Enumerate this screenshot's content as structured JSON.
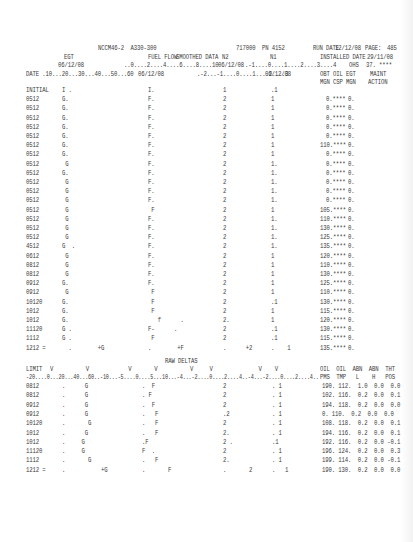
{
  "header": {
    "engine": "NCCM46-2  A330-300",
    "code": "717000",
    "pn": "PN 4152",
    "run_date_label": "RUN DATE",
    "run_date": "12/12/08",
    "page_label": "PAGE:",
    "page": "485",
    "installed_label": "INSTALLED DATE",
    "installed_date": "29/11/08",
    "ohs_label": "OHS",
    "ohs_value": "37.",
    "ohs_stars": "****"
  },
  "top_table": {
    "col_egt": "EGT",
    "col_egt_date": "06/12/08",
    "col_egt_scale": "DATE .10...20...30...40...50...60",
    "col_ff": "FUEL FLOW",
    "col_smoothed": "SMOOTHED DATA",
    "col_ff_scale": "..0....2....4....6....8....10",
    "col_ff_date": "06/12/08",
    "col_n2": "N2",
    "col_n2_date": "06/12/08",
    "col_n2_scale": ".-2...-1....0....1....2....3",
    "col_n1": "N1",
    "col_n1_scale": ".-1....0....1....2....3....4",
    "col_n1_date": "06/12/08",
    "col_right_h1": "OBT OIL EGT",
    "col_right_h2": "MGN CSP MGN",
    "col_maint_h1": "MAINT",
    "col_maint_h2": "ACTION",
    "rows": [
      {
        "date": "INITIAL",
        "egt": "I .",
        "ff": "I.",
        "n2": "1",
        "n1": ".1",
        "obt": "",
        "oil": "",
        "maint": ""
      },
      {
        "date": "0512",
        "egt": "G.",
        "ff": "F.",
        "n2": "2",
        "n1": "1",
        "obt": "0.****",
        "oil": "0."
      },
      {
        "date": "0512",
        "egt": "G.",
        "ff": "F.",
        "n2": "2",
        "n1": "1",
        "obt": "0.****",
        "oil": "0."
      },
      {
        "date": "0512",
        "egt": "G.",
        "ff": "F.",
        "n2": "2",
        "n1": "1",
        "obt": "0.****",
        "oil": "0."
      },
      {
        "date": "0512",
        "egt": "G.",
        "ff": "F.",
        "n2": "2",
        "n1": "1",
        "obt": "0.****",
        "oil": "0."
      },
      {
        "date": "0512",
        "egt": "G.",
        "ff": "F.",
        "n2": "2",
        "n1": "1",
        "obt": "0.****",
        "oil": "0."
      },
      {
        "date": "0512",
        "egt": "G.",
        "ff": "F.",
        "n2": "2",
        "n1": "1",
        "obt": "110.****",
        "oil": "0."
      },
      {
        "date": "0512",
        "egt": "G.",
        "ff": "F.",
        "n2": "2",
        "n1": "1",
        "obt": "0.****",
        "oil": "0."
      },
      {
        "date": "0512",
        "egt": " G",
        "ff": "F.",
        "n2": "2",
        "n1": "1.",
        "obt": "0.****",
        "oil": "0."
      },
      {
        "date": "0512",
        "egt": "G.",
        "ff": "F.",
        "n2": "2",
        "n1": "1.",
        "obt": "0.****",
        "oil": "0."
      },
      {
        "date": "0512",
        "egt": " G",
        "ff": "F.",
        "n2": "2",
        "n1": "1.",
        "obt": "0.****",
        "oil": "0."
      },
      {
        "date": "0512",
        "egt": " G",
        "ff": "F.",
        "n2": "2",
        "n1": "1.",
        "obt": "0.****",
        "oil": "0."
      },
      {
        "date": "0512",
        "egt": " G",
        "ff": "F.",
        "n2": "2",
        "n1": "1.",
        "obt": "0.****",
        "oil": "0."
      },
      {
        "date": "0512",
        "egt": " G",
        "ff": " F",
        "n2": "2",
        "n1": "1",
        "obt": "105.****",
        "oil": "0."
      },
      {
        "date": "0512",
        "egt": " G",
        "ff": "F.",
        "n2": "2",
        "n1": "1.",
        "obt": "110.****",
        "oil": "0."
      },
      {
        "date": "0512",
        "egt": " G",
        "ff": "F.",
        "n2": "2",
        "n1": "1.",
        "obt": "130.****",
        "oil": "0."
      },
      {
        "date": "0512",
        "egt": " G",
        "ff": "F.",
        "n2": "2",
        "n1": "1.",
        "obt": "125.****",
        "oil": "0."
      },
      {
        "date": "4512",
        "egt": "G  .",
        "ff": "F.",
        "n2": "2",
        "n1": "1.",
        "obt": "135.****",
        "oil": "0."
      },
      {
        "date": "0612",
        "egt": " G",
        "ff": "F.",
        "n2": "2",
        "n1": "1",
        "obt": "120.****",
        "oil": "0."
      },
      {
        "date": "0812",
        "egt": " G",
        "ff": "F.",
        "n2": "2",
        "n1": "1",
        "obt": "110.****",
        "oil": "0."
      },
      {
        "date": "0812",
        "egt": " G",
        "ff": "F.",
        "n2": "2",
        "n1": "1",
        "obt": "130.****",
        "oil": "0."
      },
      {
        "date": "0912",
        "egt": "G.",
        "ff": "F.",
        "n2": "2",
        "n1": "1",
        "obt": "125.****",
        "oil": "0."
      },
      {
        "date": "0912",
        "egt": " G",
        "ff": " F",
        "n2": "2",
        "n1": "1",
        "obt": "110.****",
        "oil": "0."
      },
      {
        "date": "10120",
        "egt": "G.",
        "ff": " F",
        "n2": "2",
        "n1": ".1",
        "obt": "130.****",
        "oil": "0."
      },
      {
        "date": "1012",
        "egt": "G.",
        "ff": " F",
        "n2": "2",
        "n1": "1",
        "obt": "115.****",
        "oil": "0."
      },
      {
        "date": "1012",
        "egt": "G.",
        "ff": "   f      .",
        "n2": "2.",
        "n1": "1",
        "obt": "120.****",
        "oil": "0."
      },
      {
        "date": "11120",
        "egt": "G .",
        "ff": "F-      .",
        "n2": "2",
        "n1": ".1",
        "obt": "130.****",
        "oil": "0."
      },
      {
        "date": "1112",
        "egt": "G .",
        "ff": " F",
        "n2": "2",
        "n1": ".1",
        "obt": "115.****",
        "oil": "0."
      },
      {
        "date": "1212 =",
        "egt": "  .        +G",
        "ff": ".        +F",
        "n2": ".      +2",
        "n1": ".    1",
        "obt": "135.****",
        "oil": "0."
      }
    ]
  },
  "raw_deltas": {
    "title": "RAW DELTAS",
    "limit_label": "LIMIT",
    "markers": "V          V            V       V          V     V              V    V",
    "scale": "-20....0...20...40...60..-10...-5....0....5...10...-4...-2....0....2....4..-4...-2....0....2....4..",
    "col_h1": "OIL  OIL  ABN  ABN  THT",
    "col_h2": "PMS  TMP   L    H   POS",
    "rows": [
      {
        "date": "0812",
        "g": ".      G",
        "f": ".  F",
        "n2": "2",
        "n1": ". 1",
        "vals": "190. 112.  1.0  0.0  0.0"
      },
      {
        "date": "0812",
        "g": ".      G",
        "f": ". F",
        "n2": "2",
        "n1": ". 1",
        "vals": "102. 116.  0.2  0.0  0.1"
      },
      {
        "date": "0912",
        "g": ".      G",
        "f": ".  F",
        "n2": "2",
        "n1": ". 1",
        "vals": "194. 118.  0.2  0.0  0.0"
      },
      {
        "date": "0912",
        "g": ".      G",
        "f": ".   F",
        "n2": ".2",
        "n1": ". 1",
        "vals": "0. 110.  0.2  0.0  0.0"
      },
      {
        "date": "10120",
        "g": ".       G",
        "f": ".   F",
        "n2": "2",
        "n1": ". 1",
        "vals": "108. 118.  0.2  0.0  0.1"
      },
      {
        "date": "1012",
        "g": ".      G",
        "f": ".   F",
        "n2": "2.",
        "n1": ". 1",
        "vals": "194. 116.  0.2  0.0  0.1"
      },
      {
        "date": "1012",
        "g": ".     G",
        "f": ".F",
        "n2": "2 .",
        "n1": ".1",
        "vals": "192. 116.  0.2  0.0 -0.1"
      },
      {
        "date": "11120",
        "g": ".     G",
        "f": "F  .",
        "n2": "2",
        "n1": ". 1",
        "vals": "196. 124.  0.2  0.0  0.3"
      },
      {
        "date": "1112",
        "g": ".       G",
        "f": ".   F",
        "n2": "2.",
        "n1": ". 1",
        "vals": "199. 114.  0.2  0.0 -0.1"
      },
      {
        "date": "1212 =",
        "g": ".           +G",
        "f": ".       F",
        "n2": ".       2",
        "n1": ".   1",
        "vals": "190. 130.  0.2  0.0  0.0"
      }
    ]
  }
}
